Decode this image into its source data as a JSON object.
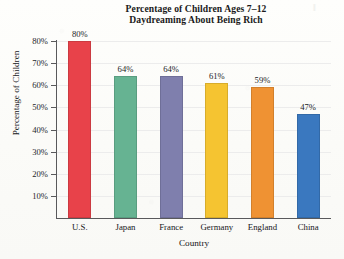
{
  "chart_data": {
    "type": "bar",
    "title": "Percentage of Children Ages 7–12 Daydreaming About Being Rich",
    "title_lines": [
      "Percentage of Children Ages 7–12",
      "Daydreaming About Being Rich"
    ],
    "xlabel": "Country",
    "ylabel": "Percentage of Children",
    "categories": [
      "U.S.",
      "Japan",
      "France",
      "Germany",
      "England",
      "China"
    ],
    "values": [
      80,
      64,
      64,
      61,
      59,
      47
    ],
    "value_labels": [
      "80%",
      "64%",
      "64%",
      "61%",
      "59%",
      "47%"
    ],
    "bar_colors": [
      "#e8424a",
      "#66b392",
      "#7f7fad",
      "#f5c431",
      "#ef9233",
      "#3a78bf"
    ],
    "ylim": [
      0,
      80
    ],
    "ytick_values": [
      80,
      70,
      60,
      50,
      40,
      30,
      20,
      10
    ],
    "ytick_labels": [
      "80%",
      "70%",
      "60%",
      "50%",
      "40%",
      "30%",
      "20%",
      "10%"
    ],
    "grid": true,
    "grid_axis": "y",
    "legend": "none",
    "units": "percent"
  },
  "artifacts": {
    "scan_mark": "‖"
  }
}
